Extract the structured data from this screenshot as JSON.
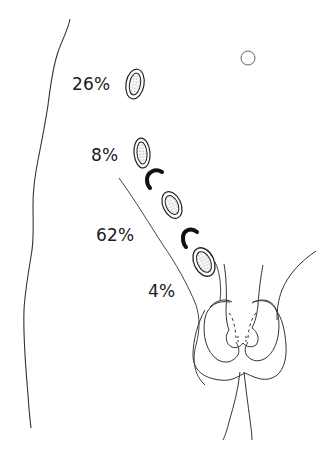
{
  "diagram": {
    "type": "anatomical-line-drawing",
    "colors": {
      "stroke": "#333333",
      "marker": "#111111",
      "text": "#1a1a1a",
      "background": "#ffffff"
    },
    "labels": [
      {
        "id": "pos1",
        "text": "26%",
        "x": 72,
        "y": 76
      },
      {
        "id": "pos2",
        "text": "8%",
        "x": 91,
        "y": 147
      },
      {
        "id": "pos3",
        "text": "62%",
        "x": 96,
        "y": 227
      },
      {
        "id": "pos4",
        "text": "4%",
        "x": 148,
        "y": 283
      }
    ],
    "testes": [
      {
        "id": "testis-1",
        "cx": 135,
        "cy": 84,
        "rx": 9,
        "ry": 15,
        "rotate": 10
      },
      {
        "id": "testis-2",
        "cx": 142,
        "cy": 153,
        "rx": 8,
        "ry": 15,
        "rotate": -5
      },
      {
        "id": "testis-3",
        "cx": 172,
        "cy": 205,
        "rx": 9,
        "ry": 14,
        "rotate": -25
      },
      {
        "id": "testis-4",
        "cx": 204,
        "cy": 262,
        "rx": 10,
        "ry": 15,
        "rotate": -25
      }
    ],
    "markers": [
      {
        "id": "arc-1",
        "note": "black C-shaped marker between positions 2 and 3"
      },
      {
        "id": "arc-2",
        "note": "black C-shaped marker between positions 3 and 4"
      }
    ],
    "small_circle": {
      "cx": 248,
      "cy": 58,
      "r": 7
    }
  }
}
